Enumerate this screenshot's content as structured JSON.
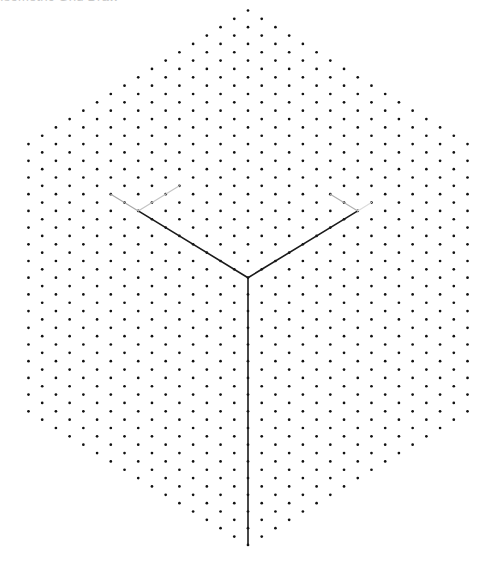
{
  "title": {
    "text": "Isometric Grid Draw",
    "color": "#c8c8c8"
  },
  "canvas": {
    "width": 493,
    "height": 574,
    "background": "#ffffff"
  },
  "grid": {
    "type": "isometric-dot-lattice",
    "shape": "hexagon",
    "origin_x": 248,
    "origin_y": 10.5,
    "column_step_px": 13.72,
    "half_row_step_px": 8.35,
    "columns_each_side": 16,
    "dots_in_center_column": 33,
    "dots_in_edge_columns": 17,
    "dot_radius": 1.35,
    "dot_color": "#111111"
  },
  "segments": [
    {
      "name": "left-edge",
      "from": [
        -8,
        24
      ],
      "to": [
        0,
        32
      ],
      "color": "#1a1a1a",
      "width": 1.6
    },
    {
      "name": "right-edge",
      "from": [
        8,
        24
      ],
      "to": [
        0,
        32
      ],
      "color": "#1a1a1a",
      "width": 1.6
    },
    {
      "name": "vertical-edge",
      "from": [
        0,
        32
      ],
      "to": [
        0,
        64
      ],
      "color": "#1a1a1a",
      "width": 1.6
    },
    {
      "name": "left-guide-back",
      "from": [
        -8,
        24
      ],
      "to": [
        -10,
        22
      ],
      "color": "#a8a8a8",
      "width": 1.2
    },
    {
      "name": "left-guide-up",
      "from": [
        -8,
        24
      ],
      "to": [
        -5,
        21
      ],
      "color": "#c4c4c4",
      "width": 1.2
    },
    {
      "name": "right-guide-back",
      "from": [
        8,
        24
      ],
      "to": [
        6,
        22
      ],
      "color": "#b0b0b0",
      "width": 1.2
    },
    {
      "name": "right-guide-out",
      "from": [
        8,
        24
      ],
      "to": [
        9,
        23
      ],
      "color": "#dcdcdc",
      "width": 1.2
    }
  ]
}
